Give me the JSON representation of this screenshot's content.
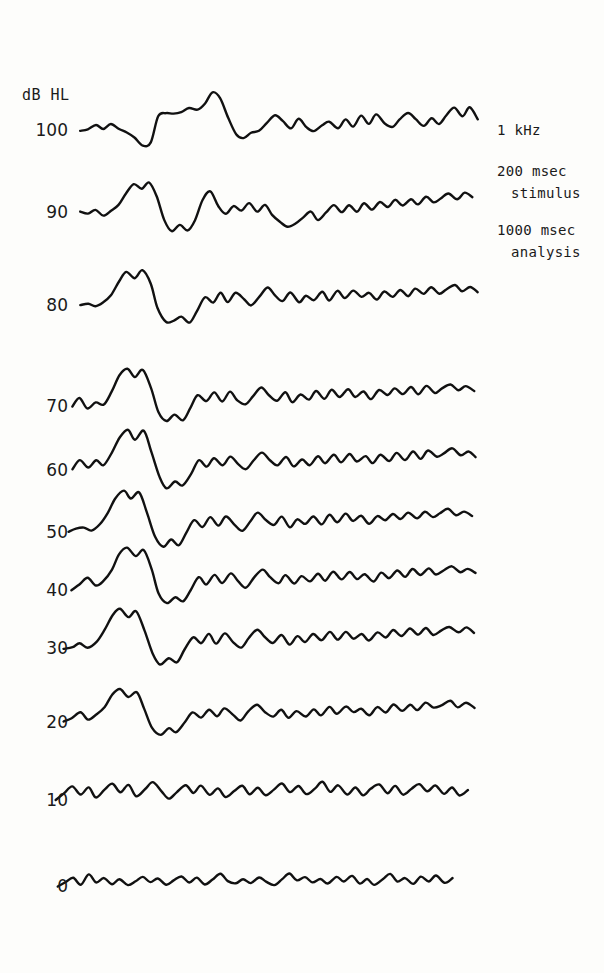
{
  "figure": {
    "axis_unit_label": "dB HL",
    "background_color": "#fdfdfb",
    "trace_color": "#111111",
    "trace_width": 2.4
  },
  "annotations": {
    "lines": [
      {
        "text": "1 kHz",
        "x": 497,
        "y": 122
      },
      {
        "text": "200 msec",
        "x": 497,
        "y": 163
      },
      {
        "text": "stimulus",
        "x": 511,
        "y": 185
      },
      {
        "text": "1000 msec",
        "x": 497,
        "y": 222
      },
      {
        "text": "analysis",
        "x": 511,
        "y": 244
      }
    ]
  },
  "chart_data": {
    "type": "line",
    "title": "",
    "xlabel": "",
    "ylabel": "dB HL",
    "subtitle": "1 kHz, 200 msec stimulus, 1000 msec analysis",
    "grid": false,
    "legend": "none",
    "x_range_msec": [
      0,
      1000
    ],
    "tick_labels": [
      "100",
      "90",
      "80",
      "70",
      "60",
      "50",
      "40",
      "30",
      "20",
      "10",
      "0"
    ],
    "series": [
      {
        "name": "100",
        "label": "100",
        "label_x": 68,
        "label_y": 130,
        "baseline_y": 130,
        "x_start": 80,
        "x_end": 478,
        "amplitude_scale": 1.0,
        "values": [
          0,
          -2,
          -9,
          -3,
          -10,
          -2,
          4,
          14,
          30,
          24,
          -26,
          -34,
          -30,
          -35,
          -42,
          -38,
          -52,
          -72,
          -60,
          -22,
          8,
          16,
          6,
          2,
          -14,
          -30,
          -16,
          -4,
          -20,
          -6,
          2,
          -10,
          -16,
          -2,
          -22,
          -8,
          -28,
          -10,
          -30,
          -14,
          -6,
          -20,
          -34,
          -20,
          -8,
          -24,
          -10,
          -28,
          -44,
          -26,
          -42,
          -20
        ]
      },
      {
        "name": "90",
        "label": "90",
        "label_x": 68,
        "label_y": 212,
        "baseline_y": 212,
        "x_start": 80,
        "x_end": 472,
        "amplitude_scale": 1.0,
        "values": [
          0,
          2,
          -4,
          6,
          -4,
          -14,
          -34,
          -54,
          -46,
          -58,
          -30,
          14,
          36,
          26,
          34,
          16,
          -24,
          -40,
          -12,
          4,
          -12,
          -4,
          -16,
          -2,
          -14,
          4,
          18,
          28,
          22,
          10,
          -2,
          14,
          2,
          -12,
          2,
          -14,
          0,
          -18,
          -6,
          -20,
          -8,
          -22,
          -12,
          -26,
          -14,
          -30,
          -18,
          -26,
          -34,
          -24,
          -36,
          -28
        ]
      },
      {
        "name": "80",
        "label": "80",
        "label_x": 68,
        "label_y": 305,
        "baseline_y": 305,
        "x_start": 80,
        "x_end": 478,
        "amplitude_scale": 1.0,
        "values": [
          0,
          -4,
          2,
          -6,
          -20,
          -46,
          -64,
          -52,
          -66,
          -40,
          6,
          32,
          30,
          22,
          34,
          10,
          -16,
          -6,
          -22,
          -6,
          -24,
          -10,
          2,
          -16,
          -34,
          -20,
          -8,
          -24,
          -4,
          -18,
          -8,
          -24,
          -10,
          -26,
          -12,
          -28,
          -14,
          -24,
          -10,
          -26,
          -16,
          -30,
          -18,
          -32,
          -20,
          -34,
          -22,
          -30,
          -38,
          -26,
          -34,
          -24
        ]
      },
      {
        "name": "70",
        "label": "70",
        "label_x": 68,
        "label_y": 406,
        "baseline_y": 406,
        "x_start": 72,
        "x_end": 474,
        "amplitude_scale": 1.0,
        "values": [
          0,
          -14,
          4,
          -8,
          -4,
          -28,
          -58,
          -72,
          -56,
          -70,
          -34,
          12,
          30,
          18,
          26,
          4,
          -22,
          -8,
          -26,
          -10,
          -28,
          -12,
          -2,
          -20,
          -36,
          -22,
          -10,
          -26,
          -8,
          -22,
          -12,
          -28,
          -14,
          -30,
          -16,
          -32,
          -18,
          -28,
          -14,
          -30,
          -20,
          -34,
          -22,
          -36,
          -24,
          -38,
          -26,
          -34,
          -42,
          -30,
          -38,
          -28
        ]
      },
      {
        "name": "60",
        "label": "60",
        "label_x": 68,
        "label_y": 470,
        "baseline_y": 470,
        "x_start": 72,
        "x_end": 476,
        "amplitude_scale": 1.0,
        "values": [
          0,
          -18,
          -6,
          -20,
          -10,
          -34,
          -62,
          -78,
          -60,
          -74,
          -36,
          14,
          34,
          22,
          30,
          6,
          -20,
          -6,
          -24,
          -8,
          -26,
          -10,
          0,
          -18,
          -34,
          -20,
          -8,
          -24,
          -6,
          -20,
          -10,
          -26,
          -12,
          -28,
          -14,
          -30,
          -16,
          -26,
          -12,
          -28,
          -18,
          -32,
          -20,
          -34,
          -22,
          -36,
          -24,
          -32,
          -40,
          -28,
          -36,
          -24
        ]
      },
      {
        "name": "50",
        "label": "50",
        "label_x": 68,
        "label_y": 532,
        "baseline_y": 532,
        "x_start": 68,
        "x_end": 472,
        "amplitude_scale": 1.0,
        "values": [
          0,
          -6,
          -10,
          -4,
          -16,
          -38,
          -66,
          -80,
          -64,
          -76,
          -38,
          10,
          28,
          16,
          24,
          2,
          -24,
          -10,
          -28,
          -12,
          -30,
          -14,
          -4,
          -22,
          -38,
          -24,
          -12,
          -28,
          -10,
          -24,
          -14,
          -30,
          -16,
          -32,
          -18,
          -34,
          -20,
          -30,
          -16,
          -32,
          -22,
          -36,
          -24,
          -38,
          -26,
          -40,
          -28,
          -36,
          -44,
          -32,
          -40,
          -30
        ]
      },
      {
        "name": "40",
        "label": "40",
        "label_x": 68,
        "label_y": 590,
        "baseline_y": 590,
        "x_start": 72,
        "x_end": 476,
        "amplitude_scale": 1.0,
        "values": [
          0,
          -12,
          -22,
          -10,
          -18,
          -40,
          -68,
          -82,
          -66,
          -78,
          -40,
          8,
          26,
          14,
          22,
          0,
          -26,
          -12,
          -30,
          -14,
          -32,
          -16,
          -6,
          -24,
          -40,
          -26,
          -14,
          -30,
          -12,
          -26,
          -16,
          -32,
          -18,
          -34,
          -20,
          -36,
          -22,
          -32,
          -18,
          -34,
          -24,
          -38,
          -26,
          -40,
          -28,
          -42,
          -30,
          -38,
          -46,
          -34,
          -42,
          -32
        ]
      },
      {
        "name": "30",
        "label": "30",
        "label_x": 68,
        "label_y": 648,
        "baseline_y": 648,
        "x_start": 64,
        "x_end": 474,
        "amplitude_scale": 1.0,
        "values": [
          0,
          -2,
          -8,
          -2,
          -12,
          -36,
          -64,
          -76,
          -58,
          -70,
          -34,
          12,
          30,
          18,
          26,
          4,
          -22,
          -8,
          -26,
          -10,
          -28,
          -12,
          -2,
          -20,
          -36,
          -22,
          -10,
          -26,
          -8,
          -22,
          -12,
          -28,
          -14,
          -30,
          -16,
          -32,
          -18,
          -28,
          -14,
          -30,
          -20,
          -34,
          -22,
          -36,
          -24,
          -38,
          -26,
          -34,
          -42,
          -30,
          -38,
          -28
        ]
      },
      {
        "name": "20",
        "label": "20",
        "label_x": 68,
        "label_y": 722,
        "baseline_y": 722,
        "x_start": 64,
        "x_end": 474,
        "amplitude_scale": 1.0,
        "values": [
          0,
          -8,
          -18,
          -6,
          -14,
          -30,
          -52,
          -64,
          -48,
          -58,
          -26,
          10,
          24,
          12,
          20,
          0,
          -20,
          -8,
          -24,
          -10,
          -26,
          -12,
          -4,
          -20,
          -34,
          -20,
          -10,
          -24,
          -8,
          -20,
          -12,
          -26,
          -14,
          -28,
          -16,
          -30,
          -18,
          -26,
          -14,
          -28,
          -20,
          -32,
          -22,
          -34,
          -24,
          -36,
          -26,
          -32,
          -40,
          -28,
          -36,
          -26
        ]
      },
      {
        "name": "10",
        "label": "10",
        "label_x": 68,
        "label_y": 800,
        "baseline_y": 800,
        "x_start": 56,
        "x_end": 468,
        "amplitude_scale": 1.0,
        "values": [
          0,
          -14,
          -26,
          -12,
          -24,
          -6,
          -20,
          -32,
          -16,
          -28,
          -8,
          -22,
          -34,
          -18,
          -4,
          -16,
          -30,
          -14,
          -26,
          -10,
          -22,
          -6,
          -18,
          -28,
          -12,
          -24,
          -8,
          -20,
          -30,
          -14,
          -26,
          -10,
          -22,
          -34,
          -16,
          -28,
          -12,
          -24,
          -8,
          -20,
          -30,
          -14,
          -26,
          -10,
          -22,
          -32,
          -16,
          -28,
          -12,
          -24,
          -8,
          -18
        ]
      },
      {
        "name": "0",
        "label": "0",
        "label_x": 68,
        "label_y": 886,
        "baseline_y": 886,
        "x_start": 58,
        "x_end": 452,
        "amplitude_scale": 1.0,
        "values": [
          0,
          -6,
          -16,
          -4,
          -22,
          -8,
          -14,
          -4,
          -12,
          -2,
          -10,
          -18,
          -6,
          -14,
          -2,
          -10,
          -20,
          -8,
          -16,
          -4,
          -12,
          -22,
          -10,
          -4,
          -14,
          -6,
          -18,
          -8,
          -2,
          -12,
          -24,
          -10,
          -16,
          -6,
          -14,
          -4,
          -18,
          -8,
          -20,
          -6,
          -12,
          -2,
          -14,
          -22,
          -8,
          -16,
          -4,
          -18,
          -10,
          -20,
          -6,
          -14
        ]
      }
    ]
  }
}
